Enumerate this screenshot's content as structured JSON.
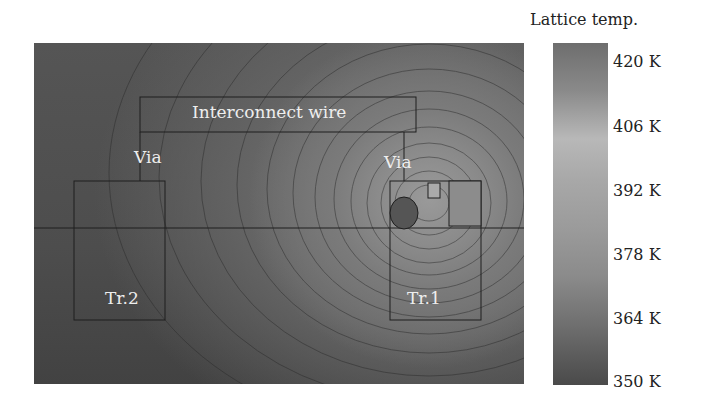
{
  "figure": {
    "labels": {
      "interconnect": "Interconnect wire",
      "via_left": "Via",
      "via_right": "Via",
      "tr2": "Tr.2",
      "tr1": "Tr.1"
    },
    "colorbar": {
      "title": "Lattice temp.",
      "ticks": [
        "420 K",
        "406 K",
        "392 K",
        "378 K",
        "364 K",
        "350 K"
      ]
    }
  }
}
